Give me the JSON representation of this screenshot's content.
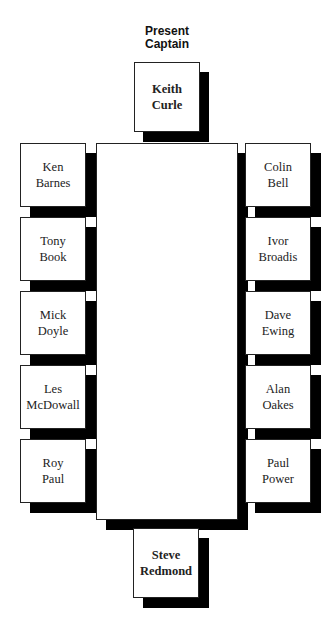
{
  "heading": "Present\nCaptain",
  "top_seat": {
    "first": "Keith",
    "last": "Curle"
  },
  "bottom_seat": {
    "first": "Steve",
    "last": "Redmond"
  },
  "left_seats": [
    {
      "first": "Ken",
      "last": "Barnes"
    },
    {
      "first": "Tony",
      "last": "Book"
    },
    {
      "first": "Mick",
      "last": "Doyle"
    },
    {
      "first": "Les",
      "last": "McDowall"
    },
    {
      "first": "Roy",
      "last": "Paul"
    }
  ],
  "right_seats": [
    {
      "first": "Colin",
      "last": "Bell"
    },
    {
      "first": "Ivor",
      "last": "Broadis"
    },
    {
      "first": "Dave",
      "last": "Ewing"
    },
    {
      "first": "Alan",
      "last": "Oakes"
    },
    {
      "first": "Paul",
      "last": "Power"
    }
  ],
  "colors": {
    "shadow": "#000000",
    "box_fill": "#ffffff",
    "border": "#222222"
  }
}
